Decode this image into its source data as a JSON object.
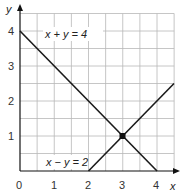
{
  "chart_data": {
    "type": "line",
    "title": "",
    "xlabel": "x",
    "ylabel": "y",
    "xlim": [
      0,
      4.5
    ],
    "ylim": [
      0,
      4.5
    ],
    "grid": true,
    "grid_step": 0.5,
    "x_ticks": [
      "0",
      "1",
      "2",
      "3",
      "4"
    ],
    "y_ticks": [
      "1",
      "2",
      "3",
      "4"
    ],
    "series": [
      {
        "name": "x + y = 4",
        "points": [
          [
            0,
            4
          ],
          [
            4,
            0
          ]
        ]
      },
      {
        "name": "x − y = 2",
        "points": [
          [
            2,
            0
          ],
          [
            4.5,
            2.5
          ]
        ]
      }
    ],
    "annotations": [
      {
        "type": "point",
        "label": "intersection",
        "x": 3,
        "y": 1
      }
    ]
  },
  "labels": {
    "x_axis": "x",
    "y_axis": "y",
    "eq1": "x + y = 4",
    "eq2": "x − y = 2",
    "origin": "0",
    "x1": "1",
    "x2": "2",
    "x3": "3",
    "x4": "4",
    "y1": "1",
    "y2": "2",
    "y3": "3",
    "y4": "4"
  }
}
